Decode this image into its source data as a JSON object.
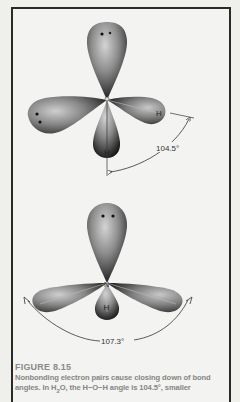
{
  "figure": {
    "number_label": "FIGURE 8.15",
    "caption_line1": "Nonbonding electron pairs cause closing down of bond",
    "caption_line2_prefix": "angles.  In H",
    "caption_line2_sub": "2",
    "caption_line2_suffix": "O, the H−O−H angle is 104.5°, smaller"
  },
  "diagrams": [
    {
      "molecule": "water",
      "central_atom": "O",
      "bonded_atom_label": "H",
      "lone_pairs": 2,
      "bond_angle_label": "104.5°"
    },
    {
      "molecule": "ammonia",
      "central_atom": "N",
      "bonded_atom_label": "H",
      "lone_pairs": 1,
      "bond_angle_label": "107.3°"
    }
  ],
  "colors": {
    "background": "#efefec",
    "frame": "#2a2a2a",
    "lobe_dark": "#1e1e1e",
    "lobe_light": "#bdbdbd",
    "caption": "#868684"
  }
}
